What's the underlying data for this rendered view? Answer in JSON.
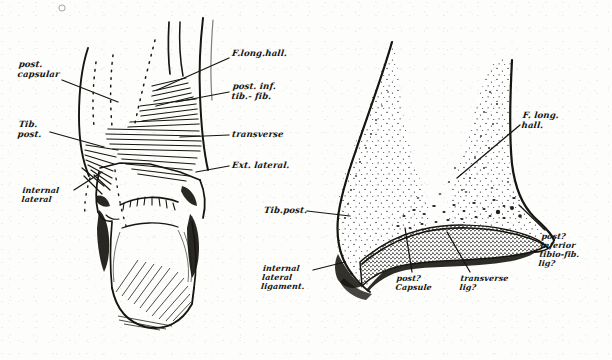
{
  "plate": {
    "title": "Posterior aspect of the ankle joint — ligaments",
    "ink_color": "#17150f",
    "paper_color": "#fdfdfc",
    "width": 612,
    "height": 360
  },
  "figures": [
    {
      "id": "left-figure",
      "name": "posterior-view-ankle",
      "caption": "Posterior view of ankle showing ligaments and tendons",
      "labels": [
        {
          "id": "post-capsular",
          "name": "label-post-capsular",
          "lines": [
            "post.",
            "capsular"
          ],
          "x": 18,
          "y": 61,
          "size": "sm",
          "leader": {
            "x1": 62,
            "y1": 80,
            "x2": 118,
            "y2": 102
          }
        },
        {
          "id": "tib-post",
          "name": "label-tib-post",
          "lines": [
            "Tib.",
            "post."
          ],
          "x": 18,
          "y": 121,
          "size": "sm",
          "leader": {
            "x1": 50,
            "y1": 132,
            "x2": 104,
            "y2": 147
          }
        },
        {
          "id": "internal-lateral",
          "name": "label-internal-lateral",
          "lines": [
            "internal",
            "lateral"
          ],
          "x": 22,
          "y": 186,
          "size": "xs",
          "leader": {
            "x1": 74,
            "y1": 190,
            "x2": 102,
            "y2": 172
          }
        },
        {
          "id": "f-long-hall-l",
          "name": "label-f-long-hall-left",
          "lines": [
            "F.long.hall."
          ],
          "x": 232,
          "y": 50,
          "size": "sm",
          "leader": {
            "x1": 229,
            "y1": 58,
            "x2": 157,
            "y2": 90
          }
        },
        {
          "id": "post-inf-tibfib",
          "name": "label-post-inf-tib-fib",
          "lines": [
            "post. inf.",
            "tib.- fib."
          ],
          "x": 232,
          "y": 83,
          "size": "sm",
          "leader": {
            "x1": 229,
            "y1": 92,
            "x2": 176,
            "y2": 102
          }
        },
        {
          "id": "transverse-l",
          "name": "label-transverse-left",
          "lines": [
            "transverse"
          ],
          "x": 232,
          "y": 131,
          "size": "sm",
          "leader": {
            "x1": 229,
            "y1": 135,
            "x2": 180,
            "y2": 137
          }
        },
        {
          "id": "ext-lateral",
          "name": "label-ext-lateral",
          "lines": [
            "Ext. lateral."
          ],
          "x": 232,
          "y": 162,
          "size": "sm",
          "leader": {
            "x1": 229,
            "y1": 166,
            "x2": 196,
            "y2": 172
          }
        }
      ]
    },
    {
      "id": "right-figure",
      "name": "sagittal-section-ankle",
      "caption": "Section through ankle joint showing capsule and transverse ligament",
      "labels": [
        {
          "id": "f-long-hall-r",
          "name": "label-f-long-hall-right",
          "lines": [
            "F. long.",
            "hall."
          ],
          "x": 522,
          "y": 112,
          "size": "sm",
          "leader": {
            "x1": 520,
            "y1": 125,
            "x2": 457,
            "y2": 178
          }
        },
        {
          "id": "tib-post-r",
          "name": "label-tib-post-right",
          "lines": [
            "Tib.post."
          ],
          "x": 264,
          "y": 207,
          "size": "sm",
          "leader": {
            "x1": 307,
            "y1": 211,
            "x2": 350,
            "y2": 216
          }
        },
        {
          "id": "internal-lat-lig",
          "name": "label-internal-lateral-ligament",
          "lines": [
            "internal",
            "lateral",
            "ligament."
          ],
          "x": 262,
          "y": 264,
          "size": "xs",
          "leader": {
            "x1": 313,
            "y1": 270,
            "x2": 345,
            "y2": 262
          }
        },
        {
          "id": "post-capsule",
          "name": "label-post-capsule",
          "lines": [
            "post?",
            "Capsule"
          ],
          "x": 396,
          "y": 274,
          "size": "xs",
          "leader": {
            "x1": 412,
            "y1": 272,
            "x2": 405,
            "y2": 228
          }
        },
        {
          "id": "transverse-lig",
          "name": "label-transverse-lig",
          "lines": [
            "transverse",
            "lig?"
          ],
          "x": 460,
          "y": 274,
          "size": "xs",
          "leader": {
            "x1": 470,
            "y1": 272,
            "x2": 447,
            "y2": 232
          }
        },
        {
          "id": "post-inf-tibfib-lig",
          "name": "label-post-inferior-tibio-fib-lig",
          "lines": [
            "post?",
            "inferior",
            "tibio-fib.",
            "lig?"
          ],
          "x": 540,
          "y": 232,
          "size": "xs",
          "leader": {
            "x1": 545,
            "y1": 230,
            "x2": 519,
            "y2": 205
          }
        }
      ]
    }
  ]
}
